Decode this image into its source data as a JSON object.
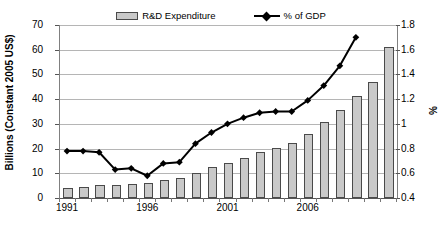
{
  "legend": {
    "position": "top-center",
    "entries": [
      {
        "label": "R&D Expenditure",
        "marker": "bar-swatch-icon"
      },
      {
        "label": "% of GDP",
        "marker": "line-diamond-icon"
      }
    ]
  },
  "axes": {
    "left_title": "Billions (Constant 2005 US$)",
    "right_title": "%",
    "left_ticks": [
      "0",
      "10",
      "20",
      "30",
      "40",
      "50",
      "60",
      "70"
    ],
    "right_ticks": [
      "0.4",
      "0.6",
      "0.8",
      "1",
      "1.2",
      "1.4",
      "1.6",
      "1.8"
    ],
    "x_ticks": [
      "1991",
      "1996",
      "2001",
      "2006"
    ]
  },
  "chart_data": {
    "type": "bar",
    "title": "",
    "subtitle": "",
    "xlabel": "",
    "ylabel": "Billions (Constant 2005 US$)",
    "y2label": "%",
    "grid": true,
    "legend_position": "top",
    "ylim": [
      0,
      70
    ],
    "y2lim": [
      0.4,
      1.8
    ],
    "yticks": [
      0,
      10,
      20,
      30,
      40,
      50,
      60,
      70
    ],
    "y2ticks": [
      0.4,
      0.6,
      0.8,
      1.0,
      1.2,
      1.4,
      1.6,
      1.8
    ],
    "categories": [
      "1991",
      "1992",
      "1993",
      "1994",
      "1995",
      "1996",
      "1997",
      "1998",
      "1999",
      "2000",
      "2001",
      "2002",
      "2003",
      "2004",
      "2005",
      "2006",
      "2007",
      "2008",
      "2009"
    ],
    "xtick_labels": [
      "1991",
      "1996",
      "2001",
      "2006"
    ],
    "series": [
      {
        "name": "R&D Expenditure",
        "type": "bar",
        "axis": "left",
        "unit": "Billions (Constant 2005 US$)",
        "color": "#c9c9c9",
        "edge_color": "#4a4a4a",
        "values": [
          4.0,
          4.6,
          5.2,
          5.3,
          5.8,
          6.2,
          7.3,
          8.2,
          10.3,
          12.6,
          14.3,
          16.2,
          18.5,
          20.4,
          22.4,
          26.1,
          30.8,
          35.6,
          41.3
        ]
      },
      {
        "name": "% of GDP",
        "type": "line",
        "axis": "right",
        "unit": "%",
        "color": "#000000",
        "marker": "diamond",
        "values": [
          0.78,
          0.78,
          0.77,
          0.63,
          0.64,
          0.58,
          0.68,
          0.69,
          0.84,
          0.93,
          1.0,
          1.05,
          1.09,
          1.1,
          1.1,
          1.19,
          1.31,
          1.47,
          1.7
        ]
      }
    ]
  },
  "extra_bars": {
    "note": "trailing bars beyond labelled years",
    "values": [
      47.0,
      61.0
    ]
  }
}
